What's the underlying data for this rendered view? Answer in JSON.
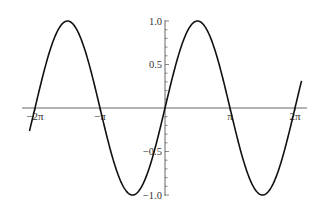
{
  "chart_data": {
    "type": "line",
    "title": "",
    "xlabel": "",
    "ylabel": "",
    "function": "sin(x)",
    "xlim": [
      -6.55,
      6.75
    ],
    "ylim": [
      -1.0,
      1.0
    ],
    "grid": false,
    "legend": null,
    "x_ticks": [
      {
        "value": -6.2832,
        "label": "-2π"
      },
      {
        "value": -3.1416,
        "label": "-π"
      },
      {
        "value": 3.1416,
        "label": "π"
      },
      {
        "value": 6.2832,
        "label": "2π"
      }
    ],
    "y_ticks": [
      {
        "value": 1.0,
        "label": "1.0"
      },
      {
        "value": 0.5,
        "label": "0.5"
      },
      {
        "value": -0.5,
        "label": "-0.5"
      },
      {
        "value": -1.0,
        "label": "-1.0"
      }
    ],
    "series": [
      {
        "name": "sin(x)",
        "color": "#111111",
        "x": [
          -6.55,
          -6.2832,
          -4.7124,
          -3.1416,
          -1.5708,
          0,
          1.5708,
          3.1416,
          4.7124,
          6.2832,
          6.6
        ],
        "values": [
          -0.26,
          0.0,
          1.0,
          0.0,
          -1.0,
          0.0,
          1.0,
          0.0,
          -1.0,
          0.0,
          0.31
        ]
      }
    ]
  },
  "colors": {
    "curve": "#111111",
    "axis": "#555555",
    "background": "#ffffff"
  }
}
